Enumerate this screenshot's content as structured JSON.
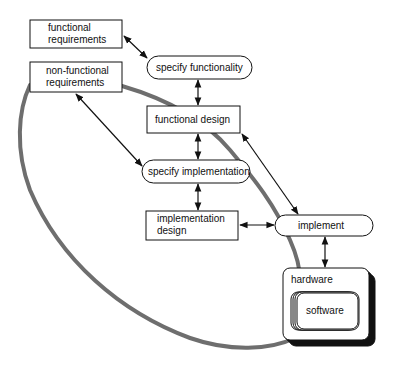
{
  "diagram": {
    "nodes": {
      "functional_requirements": {
        "line1": "functional",
        "line2": "requirements",
        "shape": "rectangle"
      },
      "non_functional_requirements": {
        "line1": "non-functional",
        "line2": "requirements",
        "shape": "rectangle"
      },
      "specify_functionality": {
        "label": "specify functionality",
        "shape": "pill"
      },
      "functional_design": {
        "label": "functional design",
        "shape": "rectangle"
      },
      "specify_implementation": {
        "label": "specify implementation",
        "shape": "pill"
      },
      "implementation_design": {
        "line1": "implementation",
        "line2": "design",
        "shape": "rectangle"
      },
      "implement": {
        "label": "implement",
        "shape": "pill"
      },
      "hardware": {
        "label": "hardware",
        "shape": "stacked-rounded-rectangle"
      },
      "software": {
        "label": "software",
        "shape": "stacked-rounded-rectangle"
      }
    },
    "edges": [
      {
        "from": "functional requirements",
        "to": "specify functionality",
        "type": "bidirectional"
      },
      {
        "from": "specify functionality",
        "to": "functional design",
        "type": "bidirectional"
      },
      {
        "from": "non-functional requirements",
        "to": "specify implementation",
        "type": "bidirectional"
      },
      {
        "from": "functional design",
        "to": "specify implementation",
        "type": "bidirectional"
      },
      {
        "from": "functional design",
        "to": "implement",
        "type": "bidirectional"
      },
      {
        "from": "specify implementation",
        "to": "implementation design",
        "type": "bidirectional"
      },
      {
        "from": "implementation design",
        "to": "implement",
        "type": "bidirectional"
      },
      {
        "from": "implement",
        "to": "hardware",
        "type": "bidirectional"
      }
    ],
    "loop": {
      "description": "gray loop linking non-functional requirements and hardware",
      "color": "#6e6e6e"
    }
  }
}
